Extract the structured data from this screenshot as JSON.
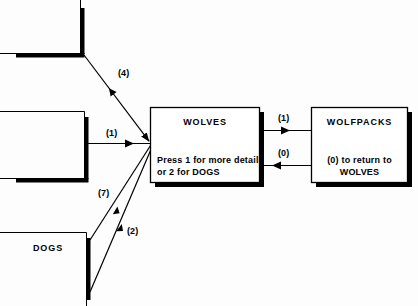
{
  "diagram": {
    "type": "menu-navigation-flow",
    "nodes": [
      {
        "id": "offscreen-top",
        "title": "",
        "body": "",
        "partial": true
      },
      {
        "id": "offscreen-middle",
        "title": "",
        "body": "",
        "partial": true
      },
      {
        "id": "dogs",
        "title": "DOGS",
        "body": "",
        "partial": true
      },
      {
        "id": "wolves",
        "title": "WOLVES",
        "body_line1": "Press 1 for more detail",
        "body_line2": "or 2 for DOGS",
        "partial": false
      },
      {
        "id": "wolfpacks",
        "title": "WOLFPACKS",
        "body_line1": "(0) to return to",
        "body_line2": "WOLVES",
        "partial": false
      }
    ],
    "edges": [
      {
        "id": "edge-4",
        "label": "(4)",
        "from": "offscreen-top",
        "to": "wolves",
        "direction": "down-right"
      },
      {
        "id": "edge-1-left",
        "label": "(1)",
        "from": "offscreen-middle",
        "to": "wolves",
        "direction": "right"
      },
      {
        "id": "edge-7",
        "label": "(7)",
        "from": "dogs",
        "to": "wolves",
        "direction": "up-right"
      },
      {
        "id": "edge-2",
        "label": "(2)",
        "from": "dogs",
        "to": "wolves",
        "direction": "up-right"
      },
      {
        "id": "edge-1-right",
        "label": "(1)",
        "from": "wolves",
        "to": "wolfpacks",
        "direction": "right"
      },
      {
        "id": "edge-0",
        "label": "(0)",
        "from": "wolfpacks",
        "to": "wolves",
        "direction": "left"
      }
    ],
    "colors": {
      "line": "#000000",
      "fill": "#ffffff",
      "background": "#fdfdfd",
      "shadow": "#000000"
    }
  }
}
